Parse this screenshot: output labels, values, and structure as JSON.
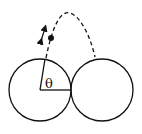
{
  "diagram": {
    "type": "physics-diagram",
    "angle_label": "θ",
    "elements": {
      "left_circle": {
        "cx": 40,
        "cy": 90,
        "r": 31
      },
      "right_circle": {
        "cx": 102,
        "cy": 90,
        "r": 31
      },
      "particle": {
        "cx": 51,
        "cy": 38
      },
      "trajectory": "dashed parabola",
      "velocity_arrow": "double-headed"
    },
    "colors": {
      "stroke": "#111111",
      "background": "#ffffff"
    }
  }
}
